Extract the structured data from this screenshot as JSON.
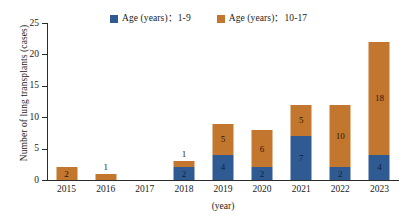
{
  "chart_data": {
    "type": "bar",
    "subtype": "stacked-vertical-bar",
    "title": "",
    "xlabel": "(year)",
    "ylabel": "Number of lung transplants (cases)",
    "categories": [
      "2015",
      "2016",
      "2017",
      "2018",
      "2019",
      "2020",
      "2021",
      "2022",
      "2023"
    ],
    "series": [
      {
        "name": "Age (years)：1-9",
        "color": "#2F5B92",
        "values": [
          0,
          0,
          0,
          2,
          4,
          2,
          7,
          2,
          4
        ]
      },
      {
        "name": "Age (years)：10-17",
        "color": "#C3762E",
        "values": [
          2,
          1,
          0,
          1,
          5,
          6,
          5,
          10,
          18
        ]
      }
    ],
    "totals": [
      2,
      1,
      0,
      3,
      9,
      8,
      12,
      12,
      22
    ],
    "ylim": [
      0,
      25
    ],
    "yticks": [
      0,
      5,
      10,
      15,
      20,
      25
    ],
    "ytick_labels": [
      "0",
      "5",
      "10",
      "15",
      "20",
      "25"
    ],
    "grid": false,
    "legend_position": "top-center",
    "bar_labels_shown": true
  },
  "legend": {
    "entries": [
      {
        "label": "Age (years)：1-9",
        "swatch": "blue",
        "color": "#2F5B92"
      },
      {
        "label": "Age (years)：10-17",
        "swatch": "orange",
        "color": "#C3762E"
      }
    ]
  },
  "axes": {
    "y_title": "Number of lung transplants (cases)",
    "x_title": "(year)"
  },
  "colors": {
    "age_1_9": "#2F5B92",
    "age_10_17": "#C3762E",
    "axis": "#2b2b2b",
    "background": "#ffffff"
  }
}
